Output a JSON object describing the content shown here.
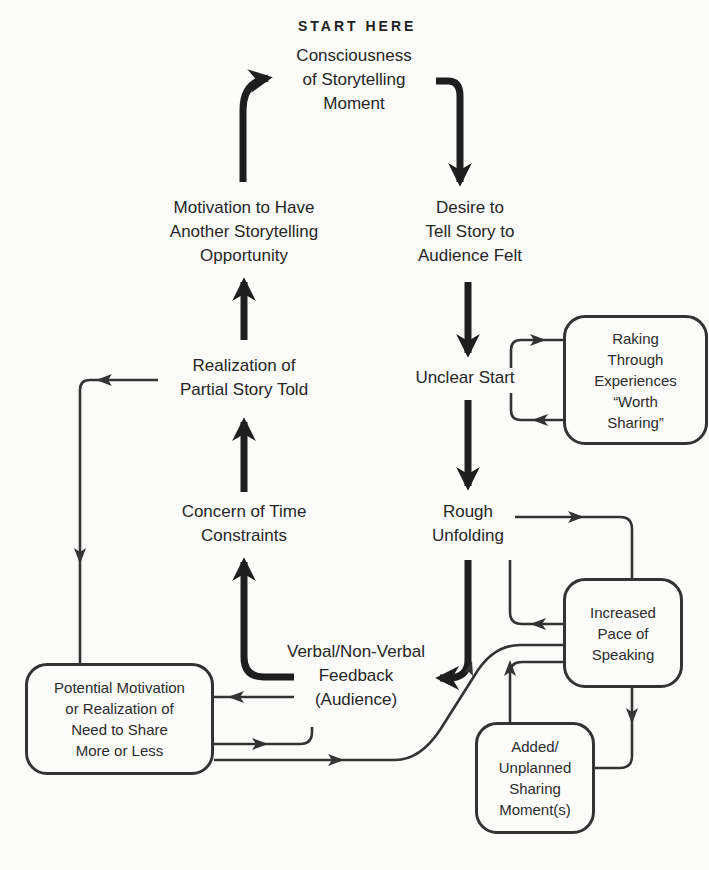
{
  "diagram": {
    "start_label": "START HERE",
    "nodes": {
      "consciousness": [
        "Consciousness",
        "of Storytelling",
        "Moment"
      ],
      "desire": [
        "Desire to",
        "Tell Story to",
        "Audience Felt"
      ],
      "unclear": [
        "Unclear Start"
      ],
      "rough": [
        "Rough",
        "Unfolding"
      ],
      "feedback": [
        "Verbal/Non-Verbal",
        "Feedback",
        "(Audience)"
      ],
      "concern": [
        "Concern of Time",
        "Constraints"
      ],
      "realization": [
        "Realization of",
        "Partial Story Told"
      ],
      "motivation": [
        "Motivation to Have",
        "Another Storytelling",
        "Opportunity"
      ]
    },
    "boxes": {
      "raking": [
        "Raking",
        "Through",
        "Experiences",
        "“Worth",
        "Sharing”"
      ],
      "pace": [
        "Increased",
        "Pace of",
        "Speaking"
      ],
      "added": [
        "Added/",
        "Unplanned",
        "Sharing",
        "Moment(s)"
      ],
      "potential": [
        "Potential Motivation",
        "or Realization of",
        "Need to Share",
        "More or Less"
      ]
    },
    "edges": [
      {
        "from": "consciousness",
        "to": "desire",
        "style": "bold"
      },
      {
        "from": "desire",
        "to": "unclear",
        "style": "bold"
      },
      {
        "from": "unclear",
        "to": "rough",
        "style": "bold"
      },
      {
        "from": "rough",
        "to": "feedback",
        "style": "bold"
      },
      {
        "from": "feedback",
        "to": "concern",
        "style": "bold"
      },
      {
        "from": "concern",
        "to": "realization",
        "style": "bold"
      },
      {
        "from": "realization",
        "to": "motivation",
        "style": "bold"
      },
      {
        "from": "motivation",
        "to": "consciousness",
        "style": "bold"
      },
      {
        "from": "unclear",
        "to": "raking",
        "style": "thin"
      },
      {
        "from": "raking",
        "to": "unclear",
        "style": "thin"
      },
      {
        "from": "rough",
        "to": "pace",
        "style": "thin"
      },
      {
        "from": "pace",
        "to": "rough",
        "style": "thin"
      },
      {
        "from": "pace",
        "to": "added",
        "style": "thin"
      },
      {
        "from": "added",
        "to": "pace",
        "style": "thin"
      },
      {
        "from": "pace",
        "to": "feedback",
        "style": "thin"
      },
      {
        "from": "feedback",
        "to": "potential",
        "style": "thin"
      },
      {
        "from": "potential",
        "to": "feedback",
        "style": "thin"
      },
      {
        "from": "realization",
        "to": "potential",
        "style": "thin"
      }
    ],
    "colors": {
      "line": "#222222",
      "thin_line": "#333333",
      "background": "#fbfbfa"
    }
  }
}
